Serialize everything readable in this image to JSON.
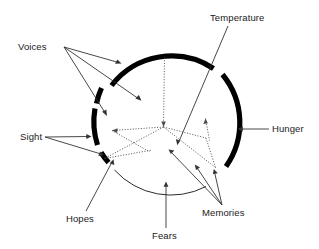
{
  "figure": {
    "type": "annotated-circle-diagram",
    "background_color": "#ffffff",
    "stroke_color": "#000000",
    "label_color": "#1a1a1a",
    "center": {
      "x": 163,
      "y": 127
    },
    "radius": 76
  },
  "labels": {
    "voices": "Voices",
    "temperature": "Temperature",
    "hunger": "Hunger",
    "sight": "Sight",
    "hopes": "Hopes",
    "fears": "Fears",
    "memories": "Memories"
  },
  "segments": [
    {
      "name": "voices-arc-top",
      "label": "Voices",
      "style": "thick",
      "start_deg": 200,
      "end_deg": 290
    },
    {
      "name": "voices-arc-small-upper",
      "label": "Voices",
      "style": "thick",
      "start_deg": 168,
      "end_deg": 178
    },
    {
      "name": "sight-arc",
      "label": "Sight",
      "style": "thick",
      "start_deg": 140,
      "end_deg": 166
    },
    {
      "name": "hopes-arc",
      "label": "Hopes",
      "style": "thick",
      "start_deg": 122,
      "end_deg": 131
    },
    {
      "name": "hunger-arc",
      "label": "Hunger",
      "style": "thick",
      "start_deg": 310,
      "end_deg": 40
    },
    {
      "name": "fears-arc",
      "label": "Fears",
      "style": "thin",
      "start_deg": 60,
      "end_deg": 118
    }
  ],
  "annotations": [
    {
      "name": "voices-leader-1",
      "from": "Voices",
      "to": "voices-arc-top"
    },
    {
      "name": "voices-leader-2",
      "from": "Voices",
      "to": "voices-arc-inner-point"
    },
    {
      "name": "voices-leader-3",
      "from": "Voices",
      "to": "voices-arc-small-upper"
    },
    {
      "name": "temperature-leader",
      "from": "Temperature",
      "to": "temperature-point"
    },
    {
      "name": "hunger-leader",
      "from": "Hunger",
      "to": "hunger-arc"
    },
    {
      "name": "sight-leader-1",
      "from": "Sight",
      "to": "sight-arc"
    },
    {
      "name": "sight-leader-2",
      "from": "Sight",
      "to": "sight-inner-point"
    },
    {
      "name": "hopes-leader",
      "from": "Hopes",
      "to": "hopes-arc"
    },
    {
      "name": "fears-leader",
      "from": "Fears",
      "to": "fears-arc"
    },
    {
      "name": "memories-leader-1",
      "from": "Memories",
      "to": "memories-point-1"
    },
    {
      "name": "memories-leader-2",
      "from": "Memories",
      "to": "memories-point-2"
    },
    {
      "name": "memories-leader-3",
      "from": "Memories",
      "to": "memories-point-3"
    }
  ],
  "interior_lines": {
    "description": "dotted radial spokes and connecting dotted paths inside the circle",
    "spokes": [
      "up",
      "lower-left",
      "lower-right"
    ]
  }
}
